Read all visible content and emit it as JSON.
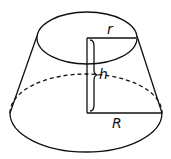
{
  "diagram": {
    "labels": {
      "top_radius": "r",
      "height": "h",
      "bottom_radius": "R"
    },
    "colors": {
      "line": "#111111",
      "background": "#ffffff"
    }
  }
}
